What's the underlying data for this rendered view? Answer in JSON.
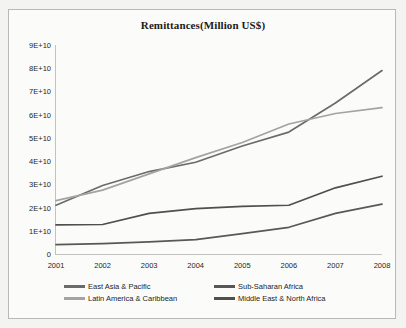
{
  "chart_data": {
    "type": "line",
    "title": "Remittances(Million US$)",
    "xlabel": "",
    "ylabel": "",
    "categories": [
      "2001",
      "2002",
      "2003",
      "2004",
      "2005",
      "2006",
      "2007",
      "2008"
    ],
    "x": [
      2001,
      2002,
      2003,
      2004,
      2005,
      2006,
      2007,
      2008
    ],
    "ylim": [
      0,
      90000000000
    ],
    "ytick_labels": [
      "0",
      "1E+10",
      "2E+10",
      "3E+10",
      "4E+10",
      "5E+10",
      "6E+10",
      "7E+10",
      "8E+10",
      "9E+10"
    ],
    "ytick_values": [
      0,
      10000000000,
      20000000000,
      30000000000,
      40000000000,
      50000000000,
      60000000000,
      70000000000,
      80000000000,
      90000000000
    ],
    "grid": false,
    "legend_position": "bottom",
    "series": [
      {
        "name": "East Asia & Pacific",
        "color": "#6b6b6b",
        "values": [
          21000000000,
          29500000000,
          35500000000,
          39500000000,
          46500000000,
          52500000000,
          65000000000,
          79000000000
        ]
      },
      {
        "name": "Sub-Saharan Africa",
        "color": "#585858",
        "values": [
          4000000000,
          4500000000,
          5200000000,
          6200000000,
          8800000000,
          11500000000,
          17500000000,
          21500000000
        ]
      },
      {
        "name": "Latin America & Caribbean",
        "color": "#a3a3a3",
        "values": [
          23000000000,
          27500000000,
          34500000000,
          41500000000,
          48000000000,
          56000000000,
          60500000000,
          63000000000
        ]
      },
      {
        "name": "Middle East & North Africa",
        "color": "#4f4f4f",
        "values": [
          12500000000,
          12700000000,
          17500000000,
          19500000000,
          20500000000,
          21000000000,
          28500000000,
          33500000000
        ]
      }
    ]
  }
}
